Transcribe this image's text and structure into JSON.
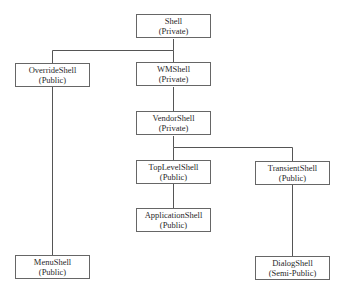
{
  "diagram": {
    "nodes": [
      {
        "id": "shell",
        "name": "Shell",
        "access": "(Private)"
      },
      {
        "id": "override",
        "name": "OverrideShell",
        "access": "(Public)"
      },
      {
        "id": "wm",
        "name": "WMShell",
        "access": "(Private)"
      },
      {
        "id": "vendor",
        "name": "VendorShell",
        "access": "(Private)"
      },
      {
        "id": "toplevel",
        "name": "TopLevelShell",
        "access": "(Public)"
      },
      {
        "id": "transient",
        "name": "TransientShell",
        "access": "(Public)"
      },
      {
        "id": "application",
        "name": "ApplicationShell",
        "access": "(Public)"
      },
      {
        "id": "menu",
        "name": "MenuShell",
        "access": "(Public)"
      },
      {
        "id": "dialog",
        "name": "DialogShell",
        "access": "(Semi-Public)"
      }
    ],
    "edges": [
      {
        "from": "shell",
        "to": "override"
      },
      {
        "from": "shell",
        "to": "wm"
      },
      {
        "from": "wm",
        "to": "vendor"
      },
      {
        "from": "vendor",
        "to": "toplevel"
      },
      {
        "from": "vendor",
        "to": "transient"
      },
      {
        "from": "toplevel",
        "to": "application"
      },
      {
        "from": "override",
        "to": "menu"
      },
      {
        "from": "transient",
        "to": "dialog"
      }
    ]
  }
}
